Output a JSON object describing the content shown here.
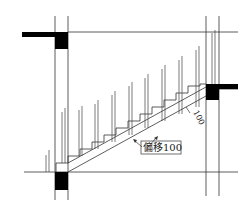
{
  "diagram": {
    "type": "stair-section-drawing",
    "annotations": {
      "offset_label": "偏移100",
      "dimension_label": "100"
    },
    "colors": {
      "line": "#333333",
      "fill": "#000000",
      "background": "#ffffff"
    },
    "risers_count": 10
  }
}
